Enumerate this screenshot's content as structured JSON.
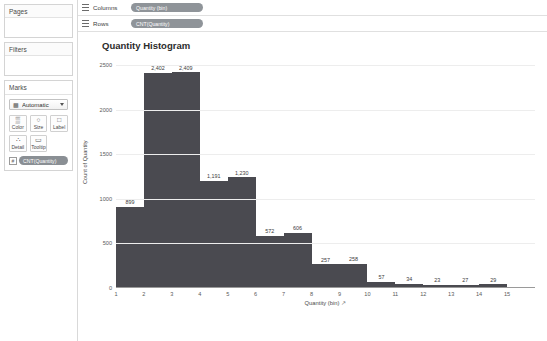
{
  "left_panel": {
    "pages": {
      "title": "Pages"
    },
    "filters": {
      "title": "Filters"
    },
    "marks": {
      "title": "Marks",
      "mark_type": "Automatic",
      "mark_type_icon": "bar-chart-icon",
      "buttons": [
        {
          "label": "Color",
          "icon": "color-palette-icon",
          "glyph": "▒"
        },
        {
          "label": "Size",
          "icon": "size-icon",
          "glyph": "○"
        },
        {
          "label": "Label",
          "icon": "label-icon",
          "glyph": "□"
        },
        {
          "label": "Detail",
          "icon": "detail-icon",
          "glyph": "∴"
        },
        {
          "label": "Tooltip",
          "icon": "tooltip-icon",
          "glyph": "▭"
        }
      ],
      "pill": "CNT(Quantity)"
    }
  },
  "shelves": [
    {
      "label": "Columns",
      "pill": "Quantity (bin)",
      "icon": "columns-grid-icon"
    },
    {
      "label": "Rows",
      "pill": "CNT(Quantity)",
      "icon": "rows-grid-icon"
    }
  ],
  "chart_data": {
    "type": "bar",
    "title": "Quantity Histogram",
    "xlabel": "Quantity (bin)",
    "ylabel": "Count of Quantity",
    "categories": [
      "1",
      "2",
      "3",
      "4",
      "5",
      "6",
      "7",
      "8",
      "9",
      "10",
      "11",
      "12",
      "13",
      "14",
      "15"
    ],
    "values": [
      899,
      2402,
      2409,
      1191,
      1230,
      572,
      606,
      257,
      258,
      57,
      34,
      23,
      27,
      29,
      0
    ],
    "value_labels": [
      "899",
      "2,402",
      "2,409",
      "1,191",
      "1,230",
      "572",
      "606",
      "257",
      "258",
      "57",
      "34",
      "23",
      "27",
      "29",
      ""
    ],
    "ylim": [
      0,
      2600
    ],
    "yticks": [
      0,
      500,
      1000,
      1500,
      2000,
      2500
    ],
    "ytick_labels": [
      "0",
      "500",
      "1000",
      "1500",
      "2000",
      "2500"
    ],
    "grid": true,
    "legend": "none",
    "bar_color": "#4a4a50",
    "sort_icon": "sort-ascending-icon"
  }
}
